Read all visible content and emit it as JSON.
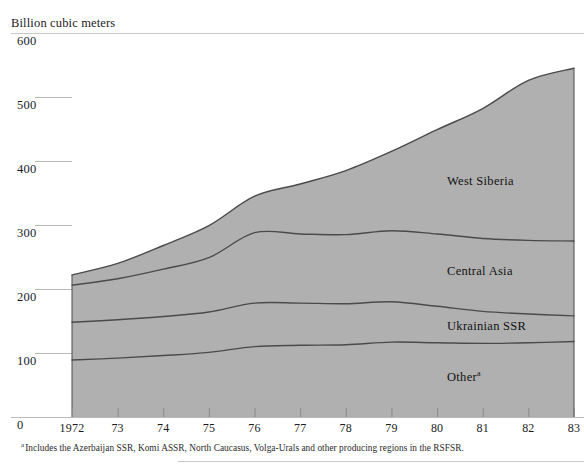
{
  "axis_title": "Billion cubic meters",
  "footnote": {
    "marker": "a",
    "text": "Includes the Azerbaijan SSR, Komi ASSR, North Caucasus, Volga-Urals and other producing regions in the RSFSR."
  },
  "series_labels": {
    "west_siberia": "West Siberia",
    "central_asia": "Central Asia",
    "ukrainian_ssr": "Ukrainian SSR",
    "other": "Other",
    "other_marker": "a"
  },
  "colors": {
    "band_fill": "#b0b0b0",
    "band_edge": "#4a4a4a",
    "gridline": "#b9b9b9",
    "rule": "#c9c9c9",
    "text": "#1c1c1c"
  },
  "chart_data": {
    "type": "area",
    "stacked": true,
    "title": "",
    "subtitle": "",
    "xlabel": "",
    "ylabel": "Billion cubic meters",
    "ylim": [
      0,
      600
    ],
    "yticks": [
      0,
      100,
      200,
      300,
      400,
      500,
      600
    ],
    "ytick_labels": [
      "0",
      "100",
      "200",
      "300",
      "400",
      "500",
      "600"
    ],
    "grid": true,
    "legend": "in-plot labels",
    "x": [
      1972,
      1973,
      1974,
      1975,
      1976,
      1977,
      1978,
      1979,
      1980,
      1981,
      1982,
      1983
    ],
    "xtick_labels": [
      "1972",
      "73",
      "74",
      "75",
      "76",
      "77",
      "78",
      "79",
      "80",
      "81",
      "82",
      "83"
    ],
    "series": [
      {
        "name": "Other",
        "values": [
          89,
          92,
          96,
          101,
          110,
          112,
          113,
          117,
          116,
          115,
          116,
          118
        ]
      },
      {
        "name": "Ukrainian SSR",
        "values": [
          59,
          60,
          61,
          63,
          68,
          66,
          64,
          63,
          57,
          50,
          45,
          40
        ]
      },
      {
        "name": "Central Asia",
        "values": [
          58,
          64,
          74,
          85,
          110,
          108,
          108,
          111,
          113,
          114,
          115,
          117
        ]
      },
      {
        "name": "West Siberia",
        "values": [
          16,
          24,
          37,
          50,
          57,
          78,
          100,
          124,
          163,
          203,
          250,
          270
        ]
      }
    ],
    "cumulative_totals": [
      222,
      240,
      268,
      299,
      345,
      364,
      385,
      415,
      449,
      482,
      526,
      545
    ],
    "band_tops": {
      "Other": [
        89,
        92,
        96,
        101,
        110,
        112,
        113,
        117,
        116,
        115,
        116,
        118
      ],
      "Ukrainian SSR": [
        148,
        152,
        157,
        164,
        178,
        178,
        177,
        180,
        173,
        165,
        161,
        158
      ],
      "Central Asia": [
        206,
        216,
        231,
        249,
        288,
        286,
        285,
        291,
        286,
        279,
        276,
        275
      ],
      "West Siberia": [
        222,
        240,
        268,
        299,
        345,
        364,
        385,
        415,
        449,
        482,
        526,
        545
      ]
    }
  },
  "geometry": {
    "plot_left": 72,
    "plot_right": 574,
    "baseline_y": 417,
    "y_at_600": 33,
    "px_per_unit": 0.64
  }
}
